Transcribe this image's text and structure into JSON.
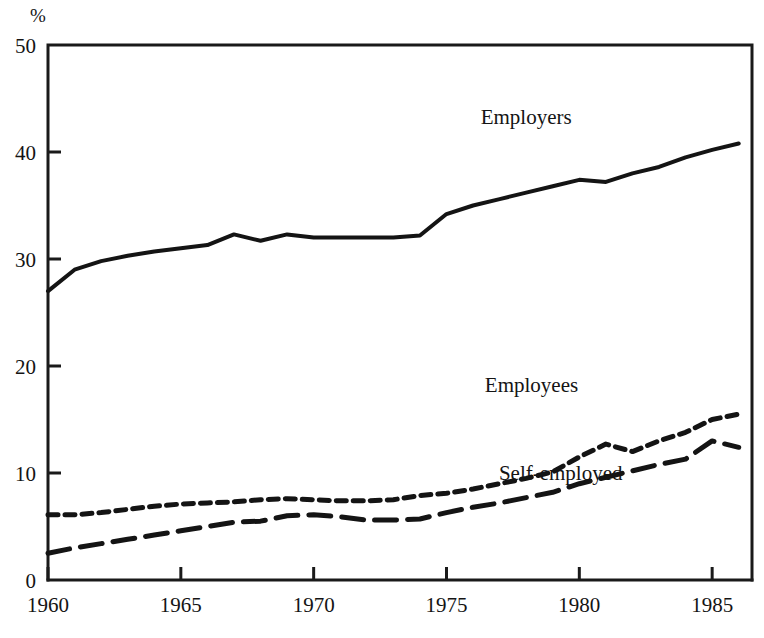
{
  "chart_data": {
    "type": "line",
    "title": "",
    "subtitle": "",
    "xlabel": "",
    "ylabel": "",
    "unit_label": "%",
    "xlim": [
      1960,
      1986.5
    ],
    "ylim": [
      0,
      50
    ],
    "grid": false,
    "legend_position": "inline-annotations",
    "x_ticks": [
      "1960",
      "1965",
      "1970",
      "1975",
      "1980",
      "1985"
    ],
    "x_tick_values": [
      1960,
      1965,
      1970,
      1975,
      1980,
      1985
    ],
    "y_ticks": [
      "0",
      "10",
      "20",
      "30",
      "40",
      "50"
    ],
    "y_tick_values": [
      0,
      10,
      20,
      30,
      40,
      50
    ],
    "x": [
      1960,
      1961,
      1962,
      1963,
      1964,
      1965,
      1966,
      1967,
      1968,
      1969,
      1970,
      1971,
      1972,
      1973,
      1974,
      1975,
      1976,
      1977,
      1978,
      1979,
      1980,
      1981,
      1982,
      1983,
      1984,
      1985,
      1986
    ],
    "series": [
      {
        "name": "Employers",
        "style": "solid",
        "label": "Employers",
        "label_x": 1978.0,
        "label_y": 42.6,
        "values": [
          27.0,
          29.0,
          29.8,
          30.3,
          30.7,
          31.0,
          31.3,
          32.3,
          31.7,
          32.3,
          32.0,
          32.0,
          32.0,
          32.0,
          32.2,
          34.2,
          35.0,
          35.6,
          36.2,
          36.8,
          37.4,
          37.2,
          38.0,
          38.6,
          39.5,
          40.2,
          40.8
        ]
      },
      {
        "name": "Employees",
        "style": "short-dash",
        "label": "Employees",
        "label_x": 1978.2,
        "label_y": 17.6,
        "values": [
          6.1,
          6.1,
          6.3,
          6.6,
          6.9,
          7.1,
          7.2,
          7.3,
          7.5,
          7.6,
          7.5,
          7.4,
          7.4,
          7.5,
          7.9,
          8.1,
          8.5,
          9.0,
          9.5,
          10.1,
          11.5,
          12.7,
          12.0,
          13.0,
          13.8,
          15.0,
          15.5
        ]
      },
      {
        "name": "Self-employed",
        "style": "long-dash",
        "label": "Self-employed",
        "label_x": 1979.3,
        "label_y": 9.3,
        "values": [
          2.5,
          3.0,
          3.4,
          3.8,
          4.2,
          4.6,
          5.0,
          5.4,
          5.5,
          6.0,
          6.1,
          5.9,
          5.6,
          5.6,
          5.7,
          6.3,
          6.8,
          7.2,
          7.7,
          8.2,
          9.0,
          9.6,
          10.2,
          10.8,
          11.3,
          13.0,
          12.4
        ]
      }
    ]
  }
}
